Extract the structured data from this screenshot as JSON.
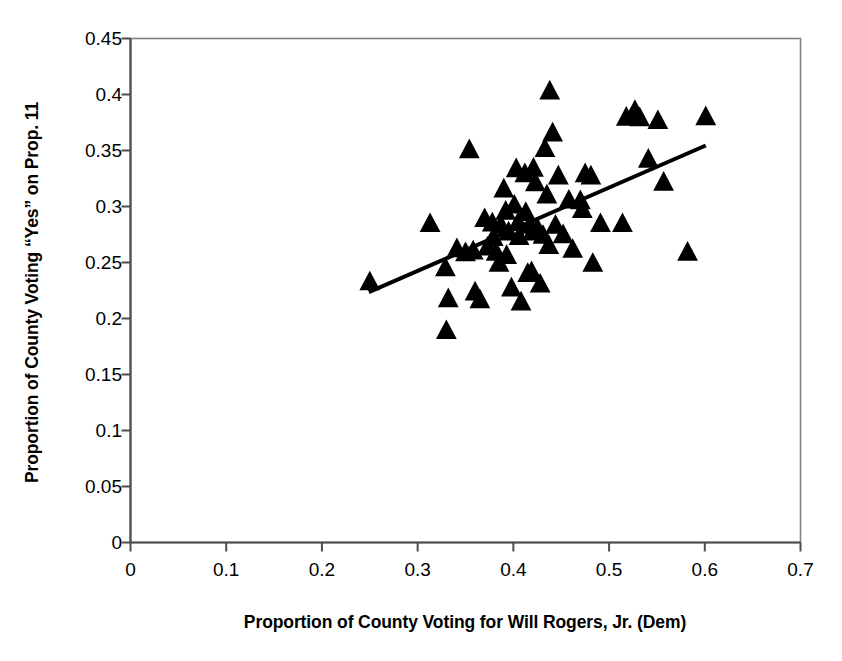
{
  "chart_data": {
    "type": "scatter",
    "title": "",
    "xlabel": "Proportion of County Voting for Will Rogers, Jr. (Dem)",
    "ylabel": "Proportion of County Voting “Yes” on Prop. 11",
    "xlim": [
      0,
      0.7
    ],
    "ylim": [
      0,
      0.45
    ],
    "xticks": [
      0,
      0.1,
      0.2,
      0.3,
      0.4,
      0.5,
      0.6,
      0.7
    ],
    "xtick_labels": [
      "0",
      "0.1",
      "0.2",
      "0.3",
      "0.4",
      "0.5",
      "0.6",
      "0.7"
    ],
    "yticks": [
      0,
      0.05,
      0.1,
      0.15,
      0.2,
      0.25,
      0.3,
      0.35,
      0.4,
      0.45
    ],
    "ytick_labels": [
      "0",
      "0.05",
      "0.1",
      "0.15",
      "0.2",
      "0.25",
      "0.3",
      "0.35",
      "0.4",
      "0.45"
    ],
    "grid": false,
    "legend": null,
    "marker": "triangle-up",
    "marker_color": "#000000",
    "marker_size": 13,
    "frame_color": "#808080",
    "axis_color": "#4d4d4d",
    "trendline": {
      "type": "linear-fit",
      "color": "#000000",
      "width": 4,
      "x_start": 0.249,
      "y_start": 0.2235,
      "x_end": 0.601,
      "y_end": 0.3545
    },
    "points": [
      {
        "x": 0.25,
        "y": 0.2325
      },
      {
        "x": 0.313,
        "y": 0.2845
      },
      {
        "x": 0.329,
        "y": 0.245
      },
      {
        "x": 0.33,
        "y": 0.189
      },
      {
        "x": 0.332,
        "y": 0.2175
      },
      {
        "x": 0.341,
        "y": 0.262
      },
      {
        "x": 0.35,
        "y": 0.2585
      },
      {
        "x": 0.354,
        "y": 0.3505
      },
      {
        "x": 0.358,
        "y": 0.26
      },
      {
        "x": 0.36,
        "y": 0.2235
      },
      {
        "x": 0.365,
        "y": 0.2165
      },
      {
        "x": 0.37,
        "y": 0.289
      },
      {
        "x": 0.373,
        "y": 0.2635
      },
      {
        "x": 0.378,
        "y": 0.285
      },
      {
        "x": 0.379,
        "y": 0.272
      },
      {
        "x": 0.382,
        "y": 0.259
      },
      {
        "x": 0.385,
        "y": 0.249
      },
      {
        "x": 0.387,
        "y": 0.283
      },
      {
        "x": 0.39,
        "y": 0.3155
      },
      {
        "x": 0.392,
        "y": 0.2955
      },
      {
        "x": 0.393,
        "y": 0.256
      },
      {
        "x": 0.395,
        "y": 0.277
      },
      {
        "x": 0.398,
        "y": 0.227
      },
      {
        "x": 0.401,
        "y": 0.301
      },
      {
        "x": 0.403,
        "y": 0.3335
      },
      {
        "x": 0.405,
        "y": 0.2855
      },
      {
        "x": 0.406,
        "y": 0.273
      },
      {
        "x": 0.408,
        "y": 0.2145
      },
      {
        "x": 0.412,
        "y": 0.329
      },
      {
        "x": 0.413,
        "y": 0.2945
      },
      {
        "x": 0.415,
        "y": 0.24
      },
      {
        "x": 0.417,
        "y": 0.283
      },
      {
        "x": 0.419,
        "y": 0.2415
      },
      {
        "x": 0.42,
        "y": 0.277
      },
      {
        "x": 0.421,
        "y": 0.334
      },
      {
        "x": 0.423,
        "y": 0.321
      },
      {
        "x": 0.425,
        "y": 0.2805
      },
      {
        "x": 0.428,
        "y": 0.2305
      },
      {
        "x": 0.431,
        "y": 0.274
      },
      {
        "x": 0.433,
        "y": 0.3515
      },
      {
        "x": 0.435,
        "y": 0.31
      },
      {
        "x": 0.437,
        "y": 0.265
      },
      {
        "x": 0.438,
        "y": 0.403
      },
      {
        "x": 0.441,
        "y": 0.3655
      },
      {
        "x": 0.444,
        "y": 0.283
      },
      {
        "x": 0.447,
        "y": 0.327
      },
      {
        "x": 0.452,
        "y": 0.2745
      },
      {
        "x": 0.458,
        "y": 0.3055
      },
      {
        "x": 0.462,
        "y": 0.2615
      },
      {
        "x": 0.47,
        "y": 0.305
      },
      {
        "x": 0.472,
        "y": 0.297
      },
      {
        "x": 0.475,
        "y": 0.329
      },
      {
        "x": 0.481,
        "y": 0.327
      },
      {
        "x": 0.483,
        "y": 0.249
      },
      {
        "x": 0.491,
        "y": 0.2845
      },
      {
        "x": 0.514,
        "y": 0.2845
      },
      {
        "x": 0.518,
        "y": 0.3795
      },
      {
        "x": 0.527,
        "y": 0.3855
      },
      {
        "x": 0.532,
        "y": 0.379
      },
      {
        "x": 0.541,
        "y": 0.342
      },
      {
        "x": 0.551,
        "y": 0.3765
      },
      {
        "x": 0.557,
        "y": 0.3215
      },
      {
        "x": 0.582,
        "y": 0.259
      },
      {
        "x": 0.601,
        "y": 0.38
      }
    ]
  }
}
